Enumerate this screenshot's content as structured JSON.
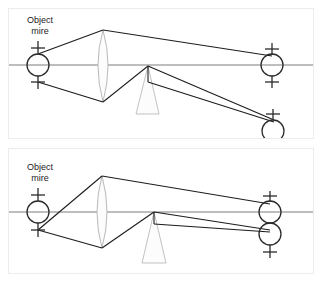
{
  "figure": {
    "width": 333,
    "height": 282,
    "background": "#ffffff",
    "panel_border_color": "#ececec",
    "ray_color": "#1a1a1a",
    "axis_color": "#777777",
    "glass_stroke": "#bdbdbd",
    "glass_fill": "#fbfbfb",
    "target_stroke": "#2b2b2b"
  },
  "panels": [
    {
      "id": "panel-top",
      "name": "panel-deviated",
      "label_line1": "Object",
      "label_line2": "mire",
      "optical_axis_y": 63,
      "components": {
        "lens": {
          "name": "biconvex-lens",
          "cx": 102,
          "top_y": 28,
          "bottom_y": 100
        },
        "prism": {
          "name": "prism",
          "apex_x": 147,
          "apex_y": 64,
          "base_left_x": 135,
          "base_right_x": 158,
          "base_y": 112
        }
      },
      "targets": [
        {
          "name": "object-mire-target",
          "cx": 37,
          "cy": 63,
          "r": 11,
          "cross_top_y": 46,
          "cross_bottom_y": 81
        },
        {
          "name": "image-target-undeviated",
          "cx": 270,
          "cy": 63,
          "r": 11,
          "cross_top_y": 47,
          "cross_bottom_y": 80
        },
        {
          "name": "image-target-deviated",
          "cx": 271,
          "cy": 126,
          "r": 11,
          "cross_top_y": 110,
          "cross_bottom_y": 141
        }
      ],
      "rays": [
        {
          "name": "ray-upper-to-lens",
          "points": "37,52 102,28"
        },
        {
          "name": "ray-upper-lens-to-image",
          "points": "102,28 270,54"
        },
        {
          "name": "ray-lower-to-lens",
          "points": "37,80 102,100"
        },
        {
          "name": "ray-lower-lens-to-prism",
          "points": "102,100 147,64"
        },
        {
          "name": "ray-prism-to-deviated-a",
          "points": "147,64 272,118"
        },
        {
          "name": "ray-prism-to-deviated-b",
          "points": "147,80 272,120"
        },
        {
          "name": "ray-prism-face-short",
          "points": "147,64 147,80"
        }
      ]
    },
    {
      "id": "panel-bottom",
      "name": "panel-aligned",
      "label_line1": "Object",
      "label_line2": "mire",
      "optical_axis_y": 70,
      "components": {
        "lens": {
          "name": "biconvex-lens",
          "cx": 101,
          "top_y": 34,
          "bottom_y": 106
        },
        "prism": {
          "name": "prism",
          "apex_x": 152,
          "apex_y": 70,
          "base_left_x": 140,
          "base_right_x": 165,
          "base_y": 120
        }
      },
      "targets": [
        {
          "name": "object-mire-target",
          "cx": 36,
          "cy": 70,
          "r": 11,
          "cross_top_y": 53,
          "cross_bottom_y": 88
        },
        {
          "name": "image-target-upper",
          "cx": 266,
          "cy": 70,
          "r": 11,
          "cross_top_y": 54,
          "cross_bottom_y": 86
        },
        {
          "name": "image-target-lower",
          "cx": 266,
          "cy": 92,
          "r": 11,
          "cross_top_y": 80,
          "cross_bottom_y": 110
        }
      ],
      "rays": [
        {
          "name": "ray-upper-to-lens",
          "points": "36,88 101,34"
        },
        {
          "name": "ray-upper-lens-to-image",
          "points": "101,34 268,62"
        },
        {
          "name": "ray-lower-to-lens",
          "points": "36,88 101,106"
        },
        {
          "name": "ray-lower-lens-to-prism",
          "points": "101,106 152,70"
        },
        {
          "name": "ray-prism-to-image-a",
          "points": "152,70 268,88"
        },
        {
          "name": "ray-prism-to-image-b",
          "points": "152,82 268,90"
        },
        {
          "name": "ray-prism-face-short",
          "points": "152,70 152,82"
        }
      ]
    }
  ]
}
